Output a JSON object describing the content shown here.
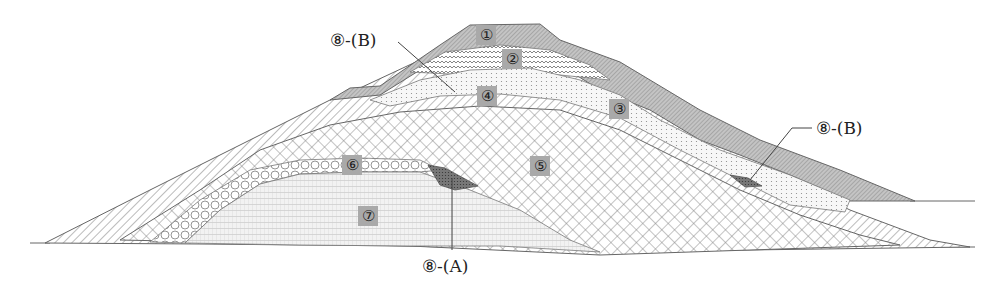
{
  "diagram": {
    "type": "geological-cross-section",
    "colors": {
      "line": "#555555",
      "layer1_fill": "#bdbdbd",
      "badge": "#a9a9a9",
      "background": "#ffffff"
    },
    "layers": [
      {
        "id": "1",
        "label": "①",
        "pattern": "dense-diagonal-hatch",
        "position": "summit cap"
      },
      {
        "id": "2",
        "label": "②",
        "pattern": "wavy-dots",
        "position": "below summit"
      },
      {
        "id": "3",
        "label": "③",
        "pattern": "fine-dots",
        "position": "right flank band"
      },
      {
        "id": "4",
        "label": "④",
        "pattern": "diagonal-hatch",
        "position": "upper mantle"
      },
      {
        "id": "5",
        "label": "⑤",
        "pattern": "cross-hatch",
        "position": "core"
      },
      {
        "id": "6",
        "label": "⑥",
        "pattern": "circles",
        "position": "thin arc over ⑦"
      },
      {
        "id": "7",
        "label": "⑦",
        "pattern": "horizontal-dash-grid",
        "position": "basal lens"
      }
    ],
    "callouts": [
      {
        "id": "8A",
        "text": "⑧-(A)",
        "target": "dark lens between ⑥ and ⑤"
      },
      {
        "id": "8B_top",
        "text": "⑧-(B)",
        "target": "upper left flank"
      },
      {
        "id": "8B_right",
        "text": "⑧-(B)",
        "target": "dark lens on right flank"
      }
    ]
  }
}
